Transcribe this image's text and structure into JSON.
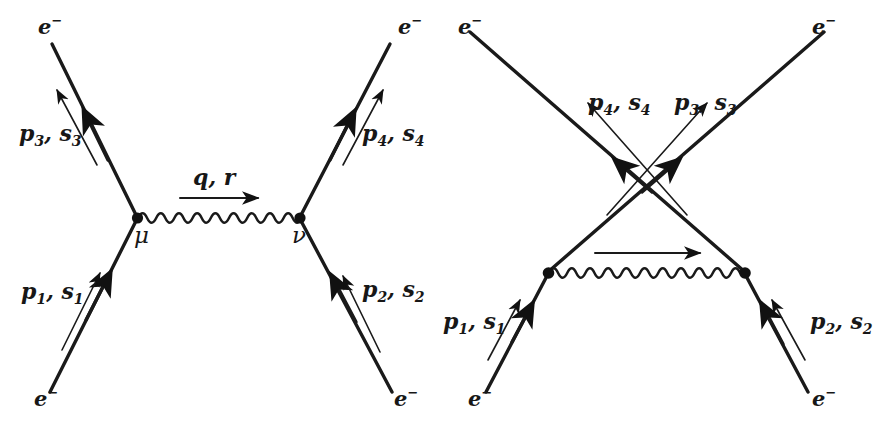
{
  "figure": {
    "background_color": "#ffffff",
    "line_color": "#1a1a1a",
    "text_color": "#171717"
  },
  "diagrams": [
    {
      "id": "direct-channel",
      "name": "direct-t-channel-diagram",
      "labels": {
        "incoming_left_particle": "e",
        "incoming_left_charge": "−",
        "incoming_right_particle": "e",
        "incoming_right_charge": "−",
        "outgoing_left_particle": "e",
        "outgoing_left_charge": "−",
        "outgoing_right_particle": "e",
        "outgoing_right_charge": "−",
        "momentum_in_left": "p",
        "momentum_in_left_sub": "1",
        "spin_in_left": "s",
        "spin_in_left_sub": "1",
        "momentum_in_right": "p",
        "momentum_in_right_sub": "2",
        "spin_in_right": "s",
        "spin_in_right_sub": "2",
        "momentum_out_left": "p",
        "momentum_out_left_sub": "3",
        "spin_out_left": "s",
        "spin_out_left_sub": "3",
        "momentum_out_right": "p",
        "momentum_out_right_sub": "4",
        "spin_out_right": "s",
        "spin_out_right_sub": "4",
        "photon_momentum": "q, r",
        "vertex_left": "μ",
        "vertex_right": "ν"
      }
    },
    {
      "id": "exchange-channel",
      "name": "exchange-u-channel-diagram",
      "labels": {
        "incoming_left_particle": "e",
        "incoming_left_charge": "−",
        "incoming_right_particle": "e",
        "incoming_right_charge": "−",
        "outgoing_left_particle": "e",
        "outgoing_left_charge": "−",
        "outgoing_right_particle": "e",
        "outgoing_right_charge": "−",
        "momentum_in_left": "p",
        "momentum_in_left_sub": "1",
        "spin_in_left": "s",
        "spin_in_left_sub": "1",
        "momentum_in_right": "p",
        "momentum_in_right_sub": "2",
        "spin_in_right": "s",
        "spin_in_right_sub": "2",
        "momentum_out_left": "p",
        "momentum_out_left_sub": "4",
        "spin_out_left": "s",
        "spin_out_left_sub": "4",
        "momentum_out_right": "p",
        "momentum_out_right_sub": "3",
        "spin_out_right": "s",
        "spin_out_right_sub": "3"
      }
    }
  ]
}
